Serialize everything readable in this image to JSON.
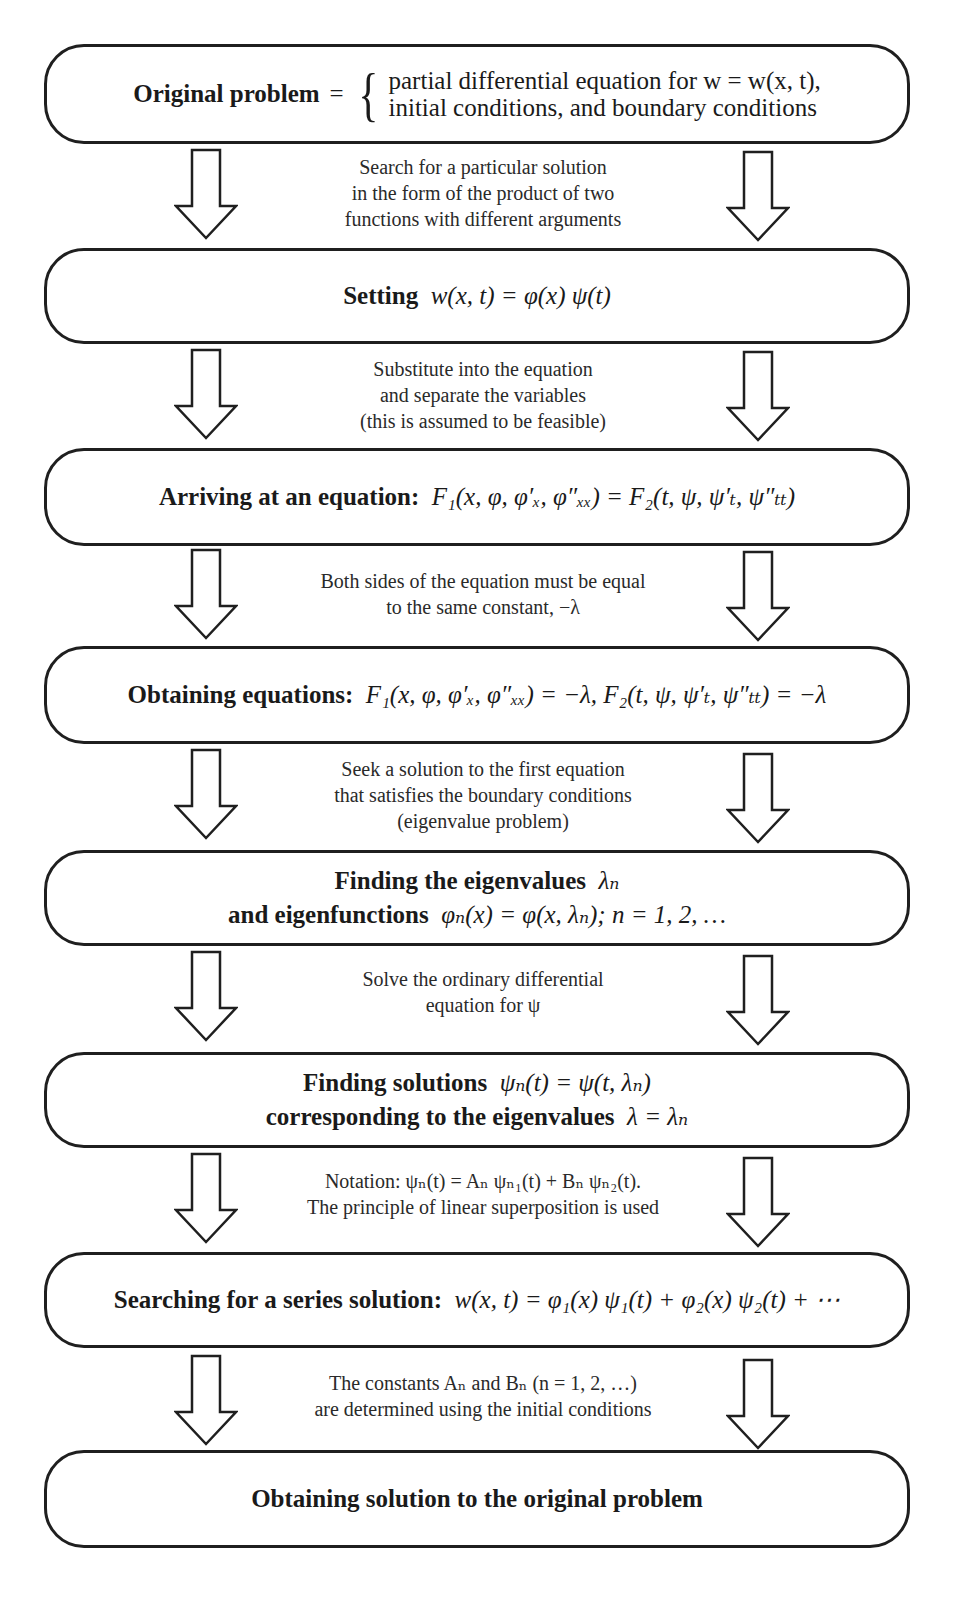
{
  "diagram": {
    "type": "flowchart",
    "boxes": [
      {
        "title": "Original problem",
        "equals": "=",
        "lines": [
          "partial differential equation for w = w(x, t),",
          "initial conditions, and boundary conditions"
        ]
      },
      {
        "label": "Setting",
        "math": "w(x, t) = φ(x) ψ(t)"
      },
      {
        "label": "Arriving at an equation:",
        "math": "F₁(x, φ, φ′ₓ, φ″ₓₓ) = F₂(t, ψ, ψ′ₜ, ψ″ₜₜ)"
      },
      {
        "label": "Obtaining equations:",
        "math": "F₁(x, φ, φ′ₓ, φ″ₓₓ) = −λ,  F₂(t, ψ, ψ′ₜ, ψ″ₜₜ) = −λ"
      },
      {
        "line1_label": "Finding the eigenvalues",
        "line1_math": "λₙ",
        "line2_label": "and eigenfunctions",
        "line2_math": "φₙ(x) = φ(x, λₙ);  n = 1, 2, …"
      },
      {
        "line1_label": "Finding solutions",
        "line1_math": "ψₙ(t) = ψ(t, λₙ)",
        "line2_label": "corresponding to the eigenvalues",
        "line2_math": "λ = λₙ"
      },
      {
        "label": "Searching for a series solution:",
        "math": "w(x, t) = φ₁(x) ψ₁(t) + φ₂(x) ψ₂(t) + ⋯"
      },
      {
        "label": "Obtaining solution to the original problem"
      }
    ],
    "transitions": [
      [
        "Search for a particular solution",
        "in the form of the product of two",
        "functions with different arguments"
      ],
      [
        "Substitute into the equation",
        "and separate the variables",
        "(this is assumed to be feasible)"
      ],
      [
        "Both sides of the equation must be equal",
        "to the same constant,  −λ"
      ],
      [
        "Seek a solution to the first equation",
        "that satisfies the boundary conditions",
        "(eigenvalue problem)"
      ],
      [
        "Solve the ordinary differential",
        "equation for ψ"
      ],
      [
        "Notation: ψₙ(t) = Aₙ ψₙ₁(t) + Bₙ ψₙ₂(t).",
        "The principle of linear superposition is used"
      ],
      [
        "The constants  Aₙ  and  Bₙ  (n = 1, 2, …)",
        "are determined using the initial conditions"
      ]
    ],
    "arrow_icon": "hollow-down-arrow-icon"
  }
}
